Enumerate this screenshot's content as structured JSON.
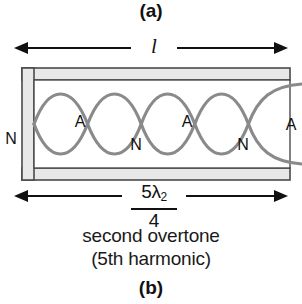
{
  "figure": {
    "panel_a_label": "(a)",
    "panel_b_label": "(b)",
    "length_label": "l",
    "wavelength_numerator": "5λ",
    "wavelength_numerator_subscript": "2",
    "wavelength_denominator": "4",
    "caption_line_1": "second overtone",
    "caption_line_2": "(5th harmonic)",
    "colors": {
      "wave": "#8a8a8a",
      "tube_fill": "#e8e8e8",
      "tube_outline": "#4a4a4a",
      "text": "#111111",
      "arrow": "#111111"
    },
    "markers": [
      {
        "name": "node-closed-end",
        "label": "N"
      },
      {
        "name": "antinode-1",
        "label": "A"
      },
      {
        "name": "node-1",
        "label": "N"
      },
      {
        "name": "antinode-2",
        "label": "A"
      },
      {
        "name": "node-2",
        "label": "N"
      },
      {
        "name": "antinode-open-end",
        "label": "A"
      }
    ],
    "physics": {
      "tube_type": "closed at one end, open at other",
      "harmonic_number": 5,
      "overtone_number": 2,
      "wave_lobes": 2.5
    }
  }
}
